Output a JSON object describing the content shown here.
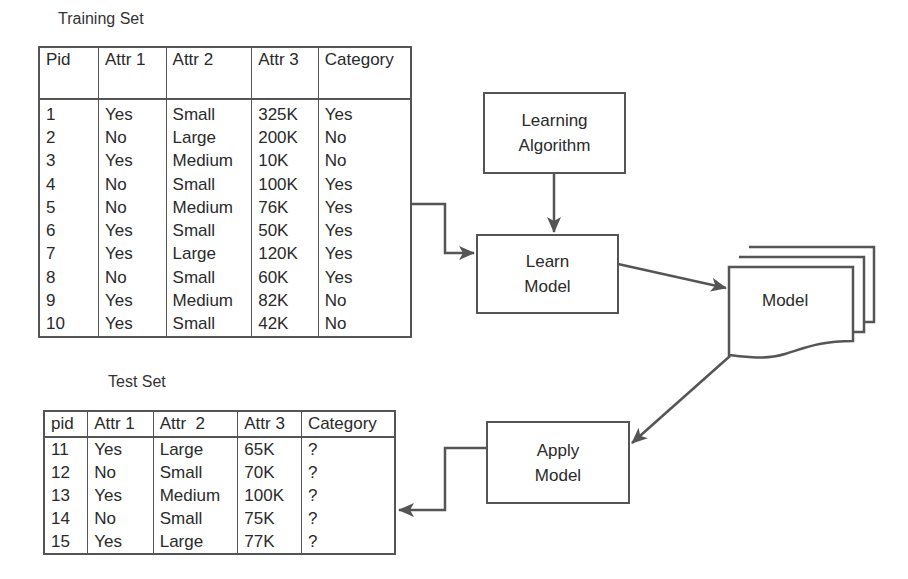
{
  "training_set": {
    "title": "Training Set",
    "columns": [
      "Pid",
      "Attr 1",
      "Attr 2",
      "Attr 3",
      "Category"
    ],
    "rows": [
      [
        "1",
        "Yes",
        "Small",
        "325K",
        "Yes"
      ],
      [
        "2",
        "No",
        "Large",
        "200K",
        "No"
      ],
      [
        "3",
        "Yes",
        "Medium",
        "10K",
        "No"
      ],
      [
        "4",
        "No",
        "Small",
        "100K",
        "Yes"
      ],
      [
        "5",
        "No",
        "Medium",
        "76K",
        "Yes"
      ],
      [
        "6",
        "Yes",
        "Small",
        "50K",
        "Yes"
      ],
      [
        "7",
        "Yes",
        "Large",
        "120K",
        "Yes"
      ],
      [
        "8",
        "No",
        "Small",
        "60K",
        "Yes"
      ],
      [
        "9",
        "Yes",
        "Medium",
        "82K",
        "No"
      ],
      [
        "10",
        "Yes",
        "Small",
        "42K",
        "No"
      ]
    ]
  },
  "test_set": {
    "title": "Test Set",
    "columns": [
      "pid",
      "Attr 1",
      "Attr  2",
      "Attr 3",
      "Category"
    ],
    "rows": [
      [
        "11",
        "Yes",
        "Large",
        "65K",
        "?"
      ],
      [
        "12",
        "No",
        "Small",
        "70K",
        "?"
      ],
      [
        "13",
        "Yes",
        "Medium",
        "100K",
        "?"
      ],
      [
        "14",
        "No",
        "Small",
        "75K",
        "?"
      ],
      [
        "15",
        "Yes",
        "Large",
        "77K",
        "?"
      ]
    ]
  },
  "nodes": {
    "learning_algorithm": {
      "line1": "Learning",
      "line2": "Algorithm"
    },
    "learn_model": {
      "line1": "Learn",
      "line2": "Model"
    },
    "model": {
      "label": "Model"
    },
    "apply_model": {
      "line1": "Apply",
      "line2": "Model"
    }
  },
  "colors": {
    "stroke": "#555555",
    "text": "#2a2a2a",
    "background": "#ffffff"
  }
}
